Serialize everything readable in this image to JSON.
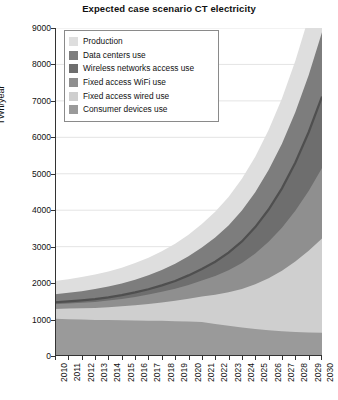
{
  "chart_data": {
    "type": "area",
    "title": "Expected case scenario CT electricity",
    "xlabel": "",
    "ylabel": "TWh/year",
    "xlim": [
      2010,
      2030
    ],
    "ylim": [
      0,
      9000
    ],
    "ytick_step": 1000,
    "grid": true,
    "stacked": true,
    "legend_position": "top-left-inside",
    "categories": [
      2010,
      2011,
      2012,
      2013,
      2014,
      2015,
      2016,
      2017,
      2018,
      2019,
      2020,
      2021,
      2022,
      2023,
      2024,
      2025,
      2026,
      2027,
      2028,
      2029,
      2030
    ],
    "x_tick_labels": [
      "2010",
      "2011",
      "2012",
      "2013",
      "2014",
      "2015",
      "2016",
      "2017",
      "2018",
      "2019",
      "2020",
      "2021",
      "2022",
      "2023",
      "2024",
      "2025",
      "2026",
      "2027",
      "2028",
      "2029",
      "2030"
    ],
    "y_tick_labels": [
      "0",
      "1000",
      "2000",
      "3000",
      "4000",
      "5000",
      "6000",
      "7000",
      "8000",
      "9000"
    ],
    "series": [
      {
        "name": "Consumer devices use",
        "color": "#9a9a9a",
        "values": [
          1020,
          1010,
          1000,
          990,
          985,
          980,
          975,
          970,
          965,
          960,
          955,
          930,
          880,
          830,
          780,
          740,
          705,
          680,
          660,
          645,
          635
        ]
      },
      {
        "name": "Fixed access wired use",
        "color": "#cfcfcf",
        "values": [
          270,
          290,
          310,
          330,
          355,
          385,
          420,
          460,
          505,
          560,
          620,
          700,
          800,
          920,
          1060,
          1230,
          1430,
          1660,
          1930,
          2240,
          2590
        ]
      },
      {
        "name": "Fixed access WiFi use",
        "color": "#8f8f8f",
        "values": [
          130,
          140,
          150,
          165,
          180,
          200,
          225,
          255,
          290,
          330,
          380,
          440,
          515,
          605,
          715,
          845,
          1000,
          1180,
          1395,
          1645,
          1935
        ]
      },
      {
        "name": "Wireless networks access use",
        "color": "#6e6e6e",
        "values": [
          55,
          60,
          68,
          78,
          90,
          105,
          124,
          148,
          178,
          215,
          262,
          320,
          392,
          480,
          590,
          722,
          884,
          1080,
          1320,
          1610,
          1960
        ]
      },
      {
        "name": "Data centers use",
        "color": "#7d7d7d",
        "values": [
          220,
          235,
          252,
          272,
          294,
          320,
          350,
          385,
          425,
          472,
          527,
          590,
          663,
          748,
          845,
          956,
          1082,
          1225,
          1386,
          1565,
          1760
        ]
      },
      {
        "name": "Production",
        "color": "#dedede",
        "values": [
          360,
          372,
          385,
          400,
          416,
          434,
          455,
          480,
          510,
          545,
          588,
          640,
          705,
          782,
          872,
          977,
          1100,
          1242,
          1404,
          1588,
          1795
        ]
      }
    ],
    "totals": [
      2055,
      2107,
      2165,
      2235,
      2320,
      2424,
      2549,
      2698,
      2873,
      3082,
      3332,
      3620,
      3955,
      4365,
      4862,
      5470,
      6201,
      7067,
      8095,
      9293,
      10675
    ],
    "legend_entries": [
      {
        "label": "Production",
        "color": "#dedede"
      },
      {
        "label": "Data centers use",
        "color": "#7d7d7d"
      },
      {
        "label": "Wireless networks access use",
        "color": "#6e6e6e"
      },
      {
        "label": "Fixed access WiFi use",
        "color": "#8f8f8f"
      },
      {
        "label": "Fixed access wired use",
        "color": "#cfcfcf"
      },
      {
        "label": "Consumer devices use",
        "color": "#9a9a9a"
      }
    ],
    "display_band_tops": {
      "comment": "Visual stack boundaries as read from the plot, TWh/year at each year",
      "consumer_devices_use": [
        1020,
        1010,
        1000,
        990,
        985,
        980,
        975,
        970,
        965,
        955,
        950,
        930,
        880,
        830,
        780,
        740,
        705,
        680,
        660,
        645,
        635
      ],
      "fixed_access_wired_use": [
        1290,
        1300,
        1310,
        1320,
        1340,
        1365,
        1395,
        1430,
        1470,
        1515,
        1570,
        1630,
        1680,
        1750,
        1840,
        1970,
        2135,
        2340,
        2590,
        2885,
        3225
      ],
      "fixed_access_wifi_use": [
        1420,
        1440,
        1460,
        1485,
        1520,
        1565,
        1620,
        1685,
        1760,
        1845,
        1950,
        2070,
        2195,
        2355,
        2555,
        2815,
        3135,
        3520,
        3985,
        4530,
        5160
      ],
      "wireless_networks_access_use": [
        1475,
        1500,
        1528,
        1563,
        1610,
        1670,
        1744,
        1833,
        1938,
        2060,
        2212,
        2390,
        2587,
        2835,
        3145,
        3537,
        4019,
        4600,
        5305,
        6140,
        7120
      ],
      "data_centers_use": [
        1695,
        1735,
        1780,
        1835,
        1904,
        1990,
        2094,
        2218,
        2363,
        2532,
        2739,
        2980,
        3250,
        3583,
        3990,
        4493,
        5101,
        5825,
        6691,
        7705,
        8880
      ],
      "production_total": [
        2055,
        2107,
        2165,
        2235,
        2320,
        2424,
        2549,
        2698,
        2873,
        3077,
        3327,
        3620,
        3955,
        4365,
        4862,
        5470,
        6201,
        7067,
        8095,
        9293,
        10675
      ]
    }
  }
}
